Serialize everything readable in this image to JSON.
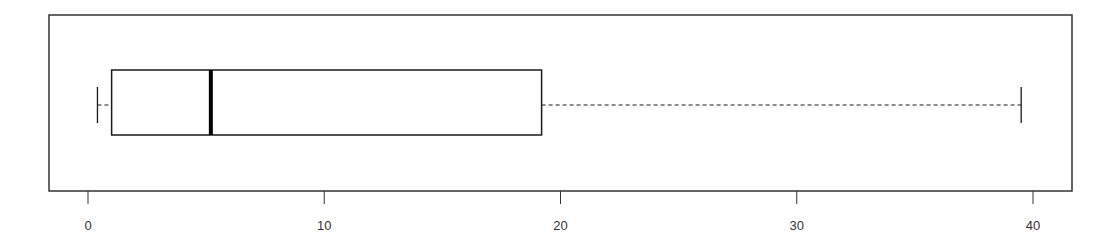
{
  "chart_data": {
    "type": "boxplot",
    "orientation": "horizontal",
    "title": "",
    "xlabel": "",
    "ylabel": "",
    "xlim": [
      -1.6,
      41.7
    ],
    "x_ticks": [
      0,
      10,
      20,
      30,
      40
    ],
    "x_tick_labels": [
      "0",
      "10",
      "20",
      "30",
      "40"
    ],
    "grid": false,
    "legend": null,
    "series": [
      {
        "name": "",
        "whisker_low": 0.4,
        "q1": 1.0,
        "median": 5.2,
        "q3": 19.2,
        "whisker_high": 39.5,
        "outliers": []
      }
    ]
  },
  "colors": {
    "box_stroke": "#1a1a1a",
    "median_stroke": "#000000",
    "axis_stroke": "#333333",
    "background": "#ffffff"
  }
}
